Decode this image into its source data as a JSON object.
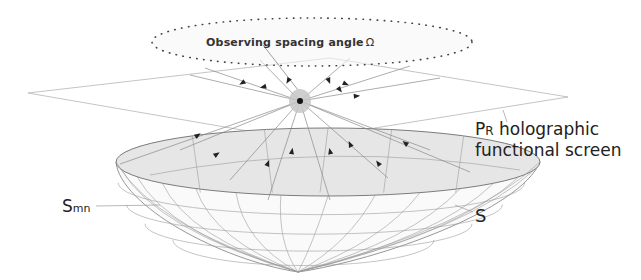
{
  "diagram": {
    "labels": {
      "observing_angle": "Observing spacing angle",
      "omega_symbol": "Ω",
      "screen_prefix": "P",
      "screen_prefix_sub": "R",
      "screen_line1": " holographic",
      "screen_line2": "functional screen",
      "smn_main": "S",
      "smn_sub": "mn",
      "s_label": "S"
    },
    "colors": {
      "line": "#9a9a9a",
      "dark": "#222222",
      "bowl_fill": "#e6e6e6",
      "dot": "#444444",
      "source_glow": "#bdbdbd"
    },
    "elements": [
      "observing-ellipse",
      "holographic-plane",
      "source-point",
      "bowl-surface-S",
      "ray-arrows"
    ]
  }
}
